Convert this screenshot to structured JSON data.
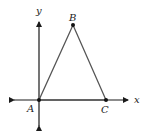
{
  "diagram": {
    "type": "coordinate-triangle",
    "axes": {
      "x_label": "x",
      "y_label": "y"
    },
    "points": [
      {
        "name": "A",
        "label": "A",
        "x": 39,
        "y": 100
      },
      {
        "name": "B",
        "label": "B",
        "x": 73,
        "y": 25
      },
      {
        "name": "C",
        "label": "C",
        "x": 106,
        "y": 100
      }
    ],
    "colors": {
      "axis": "#1a1a1a",
      "triangle": "#555555",
      "point": "#111111"
    }
  }
}
